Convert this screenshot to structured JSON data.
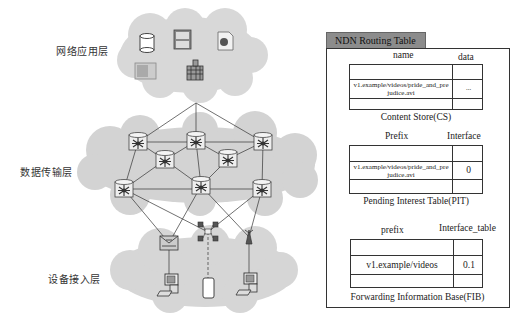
{
  "layers": {
    "application": "网络应用层",
    "transport": "数据传输层",
    "access": "设备接入层"
  },
  "icons": {
    "application": [
      "database-icon",
      "file-cabinet-icon",
      "globe-document-icon",
      "image-icon",
      "building-icon"
    ],
    "transport_nodes": 8,
    "access_relays": [
      "switch-icon",
      "hub-icon",
      "wireless-antenna-icon"
    ],
    "access_devices": [
      "desktop-pc-icon",
      "mobile-phone-icon",
      "desktop-pc-icon"
    ]
  },
  "routing_table": {
    "title": "NDN Routing Table",
    "cs": {
      "col1": "name",
      "col2": "data",
      "row_name": "v1.example/videos/pride_and_prejudice.avi",
      "row_name_line1": "v1.example/videos/pride_and_pre",
      "row_name_line2": "judice.avi",
      "row_value": "...",
      "caption": "Content Store(CS)"
    },
    "pit": {
      "col1": "Prefix",
      "col2": "Interface",
      "row_name_line1": "v1.example/videos/pride_and_pre",
      "row_name_line2": "judice.avi",
      "row_value": "0",
      "caption": "Pending Interest Table(PIT)"
    },
    "fib": {
      "col1": "prefix",
      "col2": "Interface_table",
      "row_name": "v1.example/videos",
      "row_value": "0.1",
      "caption": "Forwarding Information Base(FIB)"
    }
  },
  "colors": {
    "cloud": "#d6d6d6",
    "tab": "#8c8c8c",
    "lines": "#333333"
  }
}
